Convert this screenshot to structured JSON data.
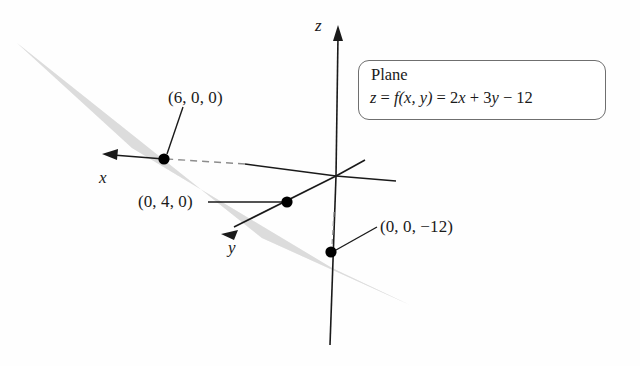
{
  "figure": {
    "background_color": "#fefefe",
    "plane_fill_color": "#dcdcdc",
    "axis_color": "#1a1a1a",
    "point_color": "#000000"
  },
  "callout": {
    "title": "Plane",
    "equation_parts": {
      "z": "z",
      "eq1": " = ",
      "f": "f",
      "args": "(x, y)",
      "eq2": " = 2",
      "x": "x",
      "plus": " + 3",
      "y": "y",
      "minus": " − 12"
    },
    "equation_plain": "z = f(x, y) = 2x + 3y − 12"
  },
  "axes": [
    {
      "name": "x-axis",
      "label": "x",
      "label_x": 99,
      "label_y": 168,
      "direction": "left-down"
    },
    {
      "name": "y-axis",
      "label": "y",
      "label_x": 228,
      "label_y": 238,
      "direction": "down-left"
    },
    {
      "name": "z-axis",
      "label": "z",
      "label_x": 315,
      "label_y": 16,
      "direction": "up"
    }
  ],
  "intercepts": [
    {
      "name": "x-intercept",
      "label": "(6, 0, 0)",
      "label_x": 168,
      "label_y": 88,
      "point_x": 164,
      "point_y": 159,
      "values": [
        6,
        0,
        0
      ]
    },
    {
      "name": "y-intercept",
      "label": "(0, 4, 0)",
      "label_x": 138,
      "label_y": 197,
      "point_x": 287,
      "point_y": 202,
      "values": [
        0,
        4,
        0
      ]
    },
    {
      "name": "z-intercept",
      "label": "(0, 0, −12)",
      "label_x": 380,
      "label_y": 222,
      "point_x": 331,
      "point_y": 252,
      "values": [
        0,
        0,
        -12
      ]
    }
  ],
  "origin": {
    "x": 336,
    "y": 176
  }
}
